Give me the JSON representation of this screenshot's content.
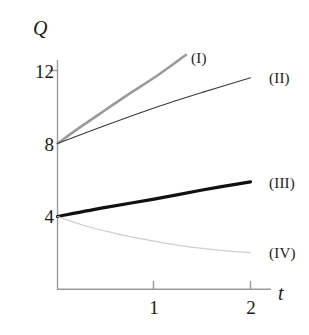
{
  "chart_data": {
    "type": "line",
    "title": "",
    "subtitle": "",
    "xlabel": "t",
    "ylabel": "Q",
    "xlim": [
      0,
      2.2
    ],
    "ylim": [
      0,
      13.6
    ],
    "xticks": [
      1,
      2
    ],
    "xtick_labels": [
      "1",
      "2"
    ],
    "yticks": [
      12,
      8,
      4
    ],
    "ytick_labels": [
      "12",
      "8",
      "4"
    ],
    "grid": false,
    "legend": "inline-right-labels",
    "annotations": [
      "(I)",
      "(II)",
      "(III)",
      "(IV)"
    ],
    "series": [
      {
        "name": "(I)",
        "label": "(I)",
        "color": "#9a9a9a",
        "width": 2.6,
        "style": "solid",
        "x": [
          0,
          0.25,
          0.5,
          0.75,
          1.0,
          1.33
        ],
        "y": [
          8.0,
          8.95,
          9.85,
          10.75,
          11.6,
          12.85
        ]
      },
      {
        "name": "(II)",
        "label": "(II)",
        "color": "#3a3a3a",
        "width": 1.1,
        "style": "solid",
        "x": [
          0,
          0.5,
          1.0,
          1.5,
          2.0
        ],
        "y": [
          8.0,
          9.0,
          9.95,
          10.8,
          11.6
        ]
      },
      {
        "name": "(III)",
        "label": "(III)",
        "color": "#111111",
        "width": 3.2,
        "style": "solid",
        "x": [
          0,
          0.5,
          1.0,
          1.5,
          2.0
        ],
        "y": [
          4.0,
          4.5,
          4.95,
          5.45,
          5.9
        ]
      },
      {
        "name": "(IV)",
        "label": "(IV)",
        "color": "#cfcfcf",
        "width": 1.2,
        "style": "solid",
        "x": [
          0,
          0.25,
          0.5,
          0.75,
          1.0,
          1.25,
          1.5,
          1.75,
          2.0
        ],
        "y": [
          4.0,
          3.55,
          3.2,
          2.9,
          2.65,
          2.42,
          2.25,
          2.12,
          2.02
        ]
      }
    ]
  },
  "axes": {
    "y_name": "Q",
    "x_name": "t",
    "y_ticks": [
      {
        "label": "12",
        "value": 12
      },
      {
        "label": "8",
        "value": 8
      },
      {
        "label": "4",
        "value": 4
      }
    ],
    "x_ticks": [
      {
        "label": "1",
        "value": 1
      },
      {
        "label": "2",
        "value": 2
      }
    ]
  },
  "curve_labels": [
    {
      "text": "(I)"
    },
    {
      "text": "(II)"
    },
    {
      "text": "(III)"
    },
    {
      "text": "(IV)"
    }
  ],
  "colors": {
    "axis": "#9a9a9a",
    "text": "#1a1a1a",
    "curve_i": "#9a9a9a",
    "curve_ii": "#3a3a3a",
    "curve_iii": "#111111",
    "curve_iv": "#cfcfcf",
    "background": "#ffffff"
  }
}
